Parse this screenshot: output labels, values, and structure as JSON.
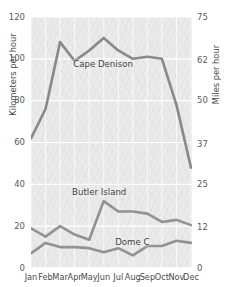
{
  "chart_data": {
    "type": "line",
    "title": "",
    "xlabel": "",
    "ylabel": "Kilometers per hour",
    "y2label": "Miles per hour",
    "categories": [
      "Jan",
      "Feb",
      "Mar",
      "Apr",
      "May",
      "Jun",
      "Jul",
      "Aug",
      "Sep",
      "Oct",
      "Nov",
      "Dec"
    ],
    "ylim": [
      0,
      120
    ],
    "yticks": [
      "0",
      "20",
      "40",
      "60",
      "80",
      "100",
      "120"
    ],
    "ytick_values": [
      0,
      20,
      40,
      60,
      80,
      100,
      120
    ],
    "y2lim": [
      0,
      75
    ],
    "y2ticks": [
      "0",
      "12",
      "25",
      "37",
      "50",
      "62",
      "75"
    ],
    "y2tick_values": [
      0,
      12,
      25,
      37,
      50,
      62,
      75
    ],
    "grid": true,
    "legend": "inline-labels",
    "series": [
      {
        "name": "Cape Denison",
        "color": "#808080",
        "values": [
          62,
          76,
          108,
          99,
          104,
          110,
          104,
          100,
          101,
          100,
          78,
          48
        ]
      },
      {
        "name": "Butler Island",
        "color": "#8a8a8a",
        "values": [
          19,
          15,
          20,
          16,
          13.5,
          32,
          27,
          27,
          26,
          22,
          23,
          20.5
        ]
      },
      {
        "name": "Dome C",
        "color": "#8a8a8a",
        "values": [
          7,
          12,
          10,
          10,
          9.5,
          7.5,
          9.5,
          6,
          10.5,
          10.5,
          13,
          12
        ]
      }
    ]
  },
  "axes": {
    "left_title": "Kilometers per hour",
    "right_title": "Miles per hour",
    "left_ticks": [
      "120",
      "100",
      "80",
      "60",
      "40",
      "20",
      "0"
    ],
    "right_ticks": [
      "75",
      "62",
      "50",
      "37",
      "25",
      "12",
      "0"
    ],
    "x_ticks": [
      "Jan",
      "Feb",
      "Mar",
      "Apr",
      "May",
      "Jun",
      "Jul",
      "Aug",
      "Sep",
      "Oct",
      "Nov",
      "Dec"
    ]
  },
  "annotations": {
    "cape_denison": "Cape Denison",
    "butler_island": "Butler Island",
    "dome_c": "Dome C"
  }
}
